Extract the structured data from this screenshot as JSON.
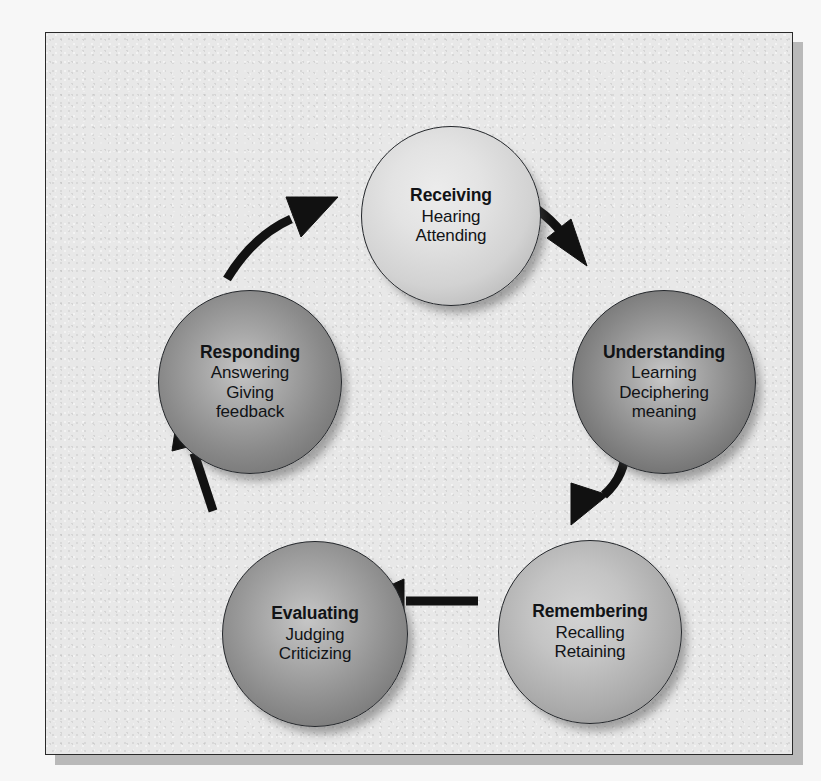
{
  "figure": {
    "type": "cycle-diagram",
    "background_color": "#e8e8e8",
    "page_color": "#f7f7f7",
    "border_color": "#2a2a2a",
    "shadow_color": "#b9b9b9",
    "arrow_color": "#111111",
    "direction": "clockwise"
  },
  "nodes": [
    {
      "id": "receiving",
      "title": "Receiving",
      "sub_lines": [
        "Hearing",
        "Attending"
      ],
      "fill": "#d9d9d9",
      "position": "top"
    },
    {
      "id": "understanding",
      "title": "Understanding",
      "sub_lines": [
        "Learning",
        "Deciphering",
        "meaning"
      ],
      "fill": "#8b8b8b",
      "position": "right"
    },
    {
      "id": "remembering",
      "title": "Remembering",
      "sub_lines": [
        "Recalling",
        "Retaining"
      ],
      "fill": "#ababab",
      "position": "bottom-right"
    },
    {
      "id": "evaluating",
      "title": "Evaluating",
      "sub_lines": [
        "Judging",
        "Criticizing"
      ],
      "fill": "#8e8e8e",
      "position": "bottom-left"
    },
    {
      "id": "responding",
      "title": "Responding",
      "sub_lines": [
        "Answering",
        "Giving",
        "feedback"
      ],
      "fill": "#8a8a8a",
      "position": "left"
    }
  ],
  "arrows": [
    {
      "id": "receiving-to-understanding",
      "from": "receiving",
      "to": "understanding",
      "shape": "curved"
    },
    {
      "id": "understanding-to-remembering",
      "from": "understanding",
      "to": "remembering",
      "shape": "curved"
    },
    {
      "id": "remembering-to-evaluating",
      "from": "remembering",
      "to": "evaluating",
      "shape": "straight"
    },
    {
      "id": "evaluating-to-responding",
      "from": "evaluating",
      "to": "responding",
      "shape": "straight"
    },
    {
      "id": "responding-to-receiving",
      "from": "responding",
      "to": "receiving",
      "shape": "curved"
    }
  ]
}
